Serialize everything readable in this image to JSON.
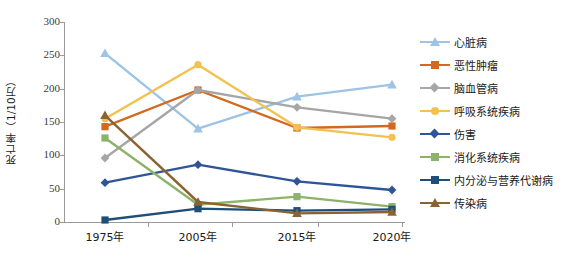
{
  "chart_data": {
    "type": "line",
    "title": "",
    "xlabel": "",
    "ylabel": "死亡率（1/10万）",
    "categories": [
      "1975年",
      "2005年",
      "2015年",
      "2020年"
    ],
    "ylim": [
      0,
      300
    ],
    "yticks": [
      0,
      50,
      100,
      150,
      200,
      250,
      300
    ],
    "grid": false,
    "legend_position": "right",
    "series": [
      {
        "name": "心脏病",
        "color": "#9DC3E6",
        "marker": "triangle",
        "values": [
          253,
          140,
          188,
          206
        ]
      },
      {
        "name": "恶性肿瘤",
        "color": "#D2691E",
        "marker": "square",
        "values": [
          143,
          198,
          141,
          144
        ]
      },
      {
        "name": "脑血管病",
        "color": "#A6A6A6",
        "marker": "diamond",
        "values": [
          96,
          198,
          172,
          155
        ]
      },
      {
        "name": "呼吸系统疾病",
        "color": "#F2C14E",
        "marker": "circle",
        "values": [
          155,
          236,
          142,
          127
        ]
      },
      {
        "name": "伤害",
        "color": "#2F5597",
        "marker": "diamond",
        "values": [
          59,
          86,
          61,
          48
        ]
      },
      {
        "name": "消化系统疾病",
        "color": "#8CB369",
        "marker": "square",
        "values": [
          126,
          26,
          38,
          23
        ]
      },
      {
        "name": "内分泌与营养代谢病",
        "color": "#1F4E79",
        "marker": "square",
        "values": [
          3,
          20,
          17,
          19
        ]
      },
      {
        "name": "传染病",
        "color": "#8B6332",
        "marker": "triangle",
        "values": [
          160,
          30,
          13,
          15
        ]
      }
    ]
  },
  "axis": {
    "y_title": "死亡率（1/10万）",
    "y_ticks": [
      "300",
      "250",
      "200",
      "150",
      "100",
      "50",
      "0"
    ],
    "x_ticks": [
      "1975年",
      "2005年",
      "2015年",
      "2020年"
    ]
  }
}
